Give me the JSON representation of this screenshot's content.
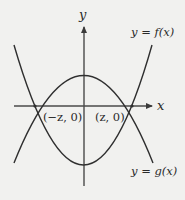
{
  "diagram": {
    "type": "function-graph",
    "axes": {
      "x_label": "x",
      "y_label": "y"
    },
    "curves": [
      {
        "id": "f",
        "label": "y = f(x)",
        "shape": "upward-opening parabola",
        "vertex_position": "below x-axis"
      },
      {
        "id": "g",
        "label": "y = g(x)",
        "shape": "downward-opening parabola",
        "vertex_position": "above x-axis"
      }
    ],
    "intersection_points": [
      {
        "label": "(−z, 0)"
      },
      {
        "label": "(z, 0)"
      }
    ],
    "colors": {
      "background": "#f1f1ef",
      "stroke": "#2f2f2f"
    }
  }
}
